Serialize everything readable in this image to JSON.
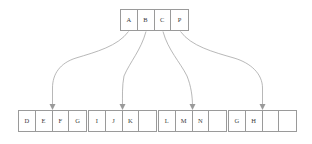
{
  "diagram": {
    "type": "tree",
    "background_color": "#ffffff",
    "stroke_color": "#9a9a9a",
    "text_color": "#3a3a3a"
  },
  "root": {
    "name": "root-node",
    "cells": [
      "A",
      "B",
      "C",
      "P"
    ]
  },
  "leaves": [
    {
      "name": "leaf-node-1",
      "cells": [
        "D",
        "E",
        "F",
        "G"
      ]
    },
    {
      "name": "leaf-node-2",
      "cells": [
        "I",
        "J",
        "K",
        ""
      ]
    },
    {
      "name": "leaf-node-3",
      "cells": [
        "L",
        "M",
        "N",
        ""
      ]
    },
    {
      "name": "leaf-node-4",
      "cells": [
        "G",
        "H",
        "",
        ""
      ]
    }
  ],
  "edges": [
    {
      "name": "edge-root-to-leaf-1",
      "from": "root.cell.0",
      "to": "leaf-node-1"
    },
    {
      "name": "edge-root-to-leaf-2",
      "from": "root.cell.1",
      "to": "leaf-node-2"
    },
    {
      "name": "edge-root-to-leaf-3",
      "from": "root.cell.2",
      "to": "leaf-node-3"
    },
    {
      "name": "edge-root-to-leaf-4",
      "from": "root.cell.3",
      "to": "leaf-node-4"
    }
  ]
}
